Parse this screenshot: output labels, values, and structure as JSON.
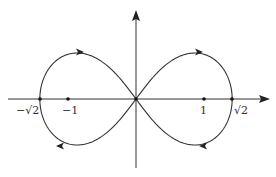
{
  "diagram": {
    "type": "lemniscate",
    "equation": "(x^2 + y^2)^2 = 2(x^2 - y^2)",
    "axes": {
      "x_arrow": true,
      "y_arrow": true
    },
    "tick_labels": [
      {
        "id": "neg-sqrt2",
        "text": "−√2",
        "value": -1.41421
      },
      {
        "id": "neg-one",
        "text": "−1",
        "value": -1
      },
      {
        "id": "pos-one",
        "text": "1",
        "value": 1
      },
      {
        "id": "pos-sqrt2",
        "text": "√2",
        "value": 1.41421
      }
    ],
    "labels": {
      "neg_sqrt2": "−√2",
      "neg_one": "−1",
      "pos_one": "1",
      "pos_sqrt2": "√2"
    },
    "marked_points": [
      -1.41421,
      -1,
      0,
      1,
      1.41421
    ],
    "direction_arrows": [
      {
        "loop": "left",
        "position": "top",
        "direction": "right"
      },
      {
        "loop": "left",
        "position": "bottom",
        "direction": "left"
      },
      {
        "loop": "right",
        "position": "top",
        "direction": "right"
      },
      {
        "loop": "right",
        "position": "bottom",
        "direction": "left"
      }
    ],
    "colors": {
      "stroke": "#333333",
      "background": "#ffffff"
    }
  }
}
